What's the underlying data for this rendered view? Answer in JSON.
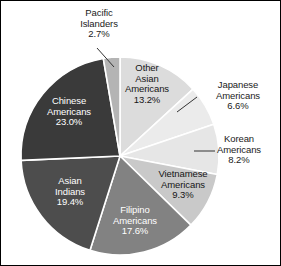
{
  "chart_data": {
    "type": "pie",
    "title": "",
    "subtitle": "",
    "xlabel": "",
    "ylabel": "",
    "legend_position": "none",
    "grid": false,
    "units": "percent",
    "total": 100.0,
    "start_angle_deg": 0,
    "direction": "clockwise",
    "categories": [
      "Other Asian Americans",
      "Japanese Americans",
      "Korean Americans",
      "Vietnamese Americans",
      "Filipino Americans",
      "Asian Indians",
      "Chinese Americans",
      "Pacific Islanders"
    ],
    "values": [
      13.2,
      6.6,
      8.2,
      9.3,
      17.6,
      19.4,
      23.0,
      2.7
    ],
    "slices": [
      {
        "name": "Other Asian Americans",
        "label_line1": "Other",
        "label_line2": "Asian",
        "label_line3": "Americans",
        "value_text": "13.2%",
        "value": 13.2,
        "color": "#dcdcdc",
        "text_color": "#151515",
        "label_placement": "inside",
        "leader_line": false
      },
      {
        "name": "Japanese Americans",
        "label_line1": "Japanese",
        "label_line2": "Americans",
        "label_line3": "",
        "value_text": "6.6%",
        "value": 6.6,
        "color": "#ebebeb",
        "text_color": "#151515",
        "label_placement": "outside",
        "leader_line": true
      },
      {
        "name": "Korean Americans",
        "label_line1": "Korean",
        "label_line2": "Americans",
        "label_line3": "",
        "value_text": "8.2%",
        "value": 8.2,
        "color": "#e6e6e6",
        "text_color": "#151515",
        "label_placement": "outside",
        "leader_line": true
      },
      {
        "name": "Vietnamese Americans",
        "label_line1": "Vietnamese",
        "label_line2": "Americans",
        "label_line3": "",
        "value_text": "9.3%",
        "value": 9.3,
        "color": "#c9c9c9",
        "text_color": "#151515",
        "label_placement": "inside",
        "leader_line": false
      },
      {
        "name": "Filipino Americans",
        "label_line1": "Filipino",
        "label_line2": "Americans",
        "label_line3": "",
        "value_text": "17.6%",
        "value": 17.6,
        "color": "#828282",
        "text_color": "#ffffff",
        "label_placement": "inside",
        "leader_line": false
      },
      {
        "name": "Asian Indians",
        "label_line1": "Asian",
        "label_line2": "Indians",
        "label_line3": "",
        "value_text": "19.4%",
        "value": 19.4,
        "color": "#4d4d4d",
        "text_color": "#ffffff",
        "label_placement": "inside",
        "leader_line": false
      },
      {
        "name": "Chinese Americans",
        "label_line1": "Chinese",
        "label_line2": "Americans",
        "label_line3": "",
        "value_text": "23.0%",
        "value": 23.0,
        "color": "#3a3a3a",
        "text_color": "#ffffff",
        "label_placement": "inside",
        "leader_line": false
      },
      {
        "name": "Pacific Islanders",
        "label_line1": "Pacific",
        "label_line2": "Islanders",
        "label_line3": "",
        "value_text": "2.7%",
        "value": 2.7,
        "color": "#b4b4b4",
        "text_color": "#151515",
        "label_placement": "outside",
        "leader_line": true
      }
    ],
    "style": {
      "separator_color": "#ffffff",
      "separator_width": 1.6,
      "border_color": "#000000",
      "background": "#ffffff",
      "center_x": 119,
      "center_y": 155,
      "radius": 99
    }
  }
}
